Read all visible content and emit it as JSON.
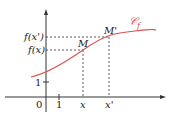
{
  "diagram": {
    "title": "",
    "colors": {
      "curve": "#d9534f",
      "axes": "#333333",
      "dashed": "#333333"
    },
    "labels": {
      "origin": "0",
      "x_unit": "1",
      "y_unit": "1",
      "x": "x",
      "x_prime": "x'",
      "fx": "f(x)",
      "fx_prime": "f(x')",
      "point_M": "M",
      "point_M_prime": "M'",
      "curve_name": "𝒞",
      "curve_subscript": "f"
    }
  }
}
